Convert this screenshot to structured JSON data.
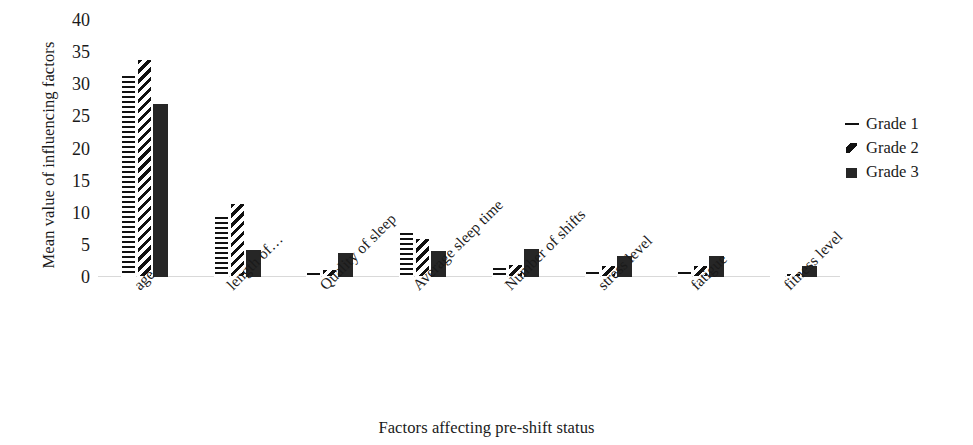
{
  "chart_data": {
    "type": "bar",
    "title": "",
    "xlabel": "Factors affecting pre-shift status",
    "ylabel": "Mean value of influencing factors",
    "categories": [
      "age",
      "length of…",
      "Quality of sleep",
      "Average sleep time",
      "Number of shifts",
      "stress level",
      "fatigue",
      "fitness level"
    ],
    "series": [
      {
        "name": "Grade 1",
        "pattern": "horizontal-lines",
        "values": [
          31.5,
          9.5,
          0.8,
          7.0,
          1.5,
          1.0,
          1.0,
          0.2
        ]
      },
      {
        "name": "Grade 2",
        "pattern": "diagonal-hatch",
        "values": [
          34.0,
          11.5,
          1.2,
          6.0,
          2.0,
          1.8,
          1.8,
          0.6
        ]
      },
      {
        "name": "Grade 3",
        "pattern": "solid-black",
        "values": [
          27.0,
          4.2,
          3.8,
          4.0,
          4.3,
          3.2,
          3.3,
          1.7
        ]
      }
    ],
    "ylim": [
      0,
      40
    ],
    "yticks": [
      0,
      5,
      10,
      15,
      20,
      25,
      30,
      35,
      40
    ],
    "ytick_labels": [
      "0",
      "5",
      "10",
      "15",
      "20",
      "25",
      "30",
      "35",
      "40"
    ],
    "grid": false,
    "legend_position": "right",
    "colors": {
      "bar_ink": "#111111",
      "bar_solid": "#262626",
      "axis_line": "#d9d9d9",
      "text": "#1a1a1a",
      "background": "#ffffff"
    }
  },
  "legend": {
    "items": [
      {
        "label": "Grade 1",
        "marker": "dash-marker"
      },
      {
        "label": "Grade 2",
        "marker": "diagonal-stroke-marker"
      },
      {
        "label": "Grade 3",
        "marker": "filled-square-marker"
      }
    ]
  }
}
